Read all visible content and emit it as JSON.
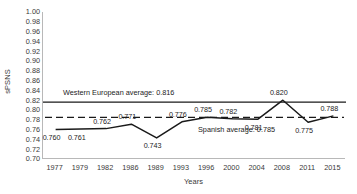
{
  "chart_data": {
    "type": "line",
    "title": "",
    "xlabel": "Years",
    "ylabel": "sPSNS",
    "categories": [
      "1977",
      "1979",
      "1982",
      "1986",
      "1989",
      "1993",
      "1996",
      "2000",
      "2004",
      "2008",
      "2011",
      "2015"
    ],
    "values": [
      0.76,
      0.761,
      0.762,
      0.771,
      0.743,
      0.776,
      0.785,
      0.782,
      0.781,
      0.82,
      0.775,
      0.788
    ],
    "point_labels": [
      "0.760",
      "0.761",
      "0.762",
      "0.771",
      "0.743",
      "0.776",
      "0.785",
      "0.782",
      "0.781",
      "0.820",
      "0.775",
      "0.788"
    ],
    "ylim": [
      0.7,
      1.0
    ],
    "ytick_step": 0.02,
    "ytick_labels": [
      "1.00",
      "0.98",
      "0.96",
      "0.94",
      "0.92",
      "0.90",
      "0.88",
      "0.86",
      "0.84",
      "0.82",
      "0.80",
      "0.78",
      "0.76",
      "0.74",
      "0.72",
      "0.70"
    ],
    "grid": false,
    "legend_position": "none",
    "series_color": "#1a1a1a",
    "reference_lines": [
      {
        "name": "western-european-average",
        "label": "Western European average: 0.816",
        "value": 0.816,
        "style": "solid",
        "color": "#1a1a1a"
      },
      {
        "name": "spanish-average",
        "label": "Spanish average: 0.785",
        "value": 0.785,
        "style": "dashed",
        "color": "#1a1a1a"
      }
    ]
  }
}
